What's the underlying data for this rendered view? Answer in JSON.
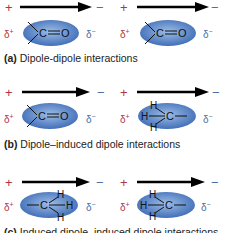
{
  "colors": {
    "positive": "#b0373f",
    "negative": "#4a6fa5",
    "ellipse_light": "#8fb0e0",
    "ellipse_dark": "#3f6fb8",
    "arrow": "#000000"
  },
  "symbols": {
    "plus": "+",
    "minus": "−",
    "delta_plus": "δ",
    "delta_plus_sup": "+",
    "delta_minus": "δ",
    "delta_minus_sup": "−"
  },
  "panels": [
    {
      "letter": "(a)",
      "caption": "Dipole-dipole interactions",
      "molecules": [
        {
          "type": "carbonyl",
          "atoms": [
            "C",
            "O"
          ]
        },
        {
          "type": "carbonyl",
          "atoms": [
            "C",
            "O"
          ]
        }
      ]
    },
    {
      "letter": "(b)",
      "caption": "Dipole–induced dipole interactions",
      "molecules": [
        {
          "type": "carbonyl",
          "atoms": [
            "C",
            "O"
          ]
        },
        {
          "type": "methyl-left",
          "atoms": [
            "H",
            "H",
            "H",
            "C"
          ]
        }
      ]
    },
    {
      "letter": "(c)",
      "caption": "Induced dipole–induced dipole interactions",
      "molecules": [
        {
          "type": "methyl-right",
          "atoms": [
            "C",
            "H",
            "H",
            "H"
          ]
        },
        {
          "type": "methyl-left",
          "atoms": [
            "H",
            "H",
            "H",
            "C"
          ]
        }
      ]
    }
  ]
}
